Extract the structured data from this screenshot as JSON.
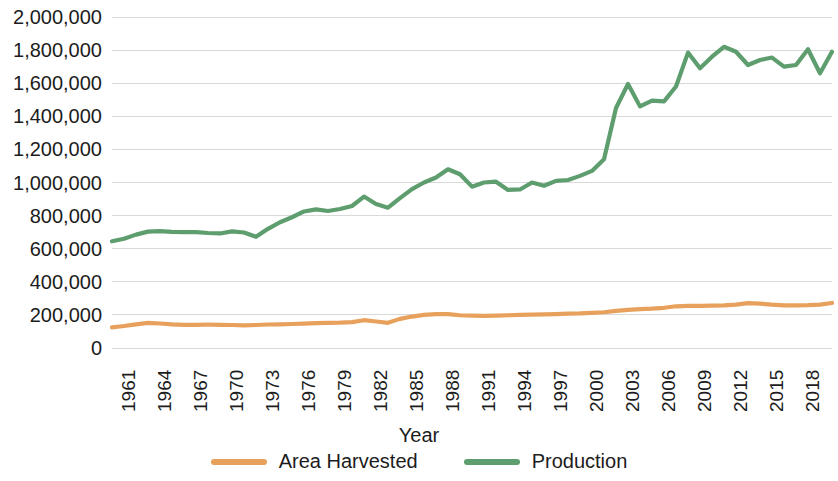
{
  "chart_data": {
    "type": "line",
    "title": "",
    "xlabel": "Year",
    "ylabel": "",
    "grid": true,
    "legend_position": "bottom",
    "xlim": [
      1961,
      2021
    ],
    "ylim": [
      0,
      2000000
    ],
    "y_ticks": [
      "0",
      "200,000",
      "400,000",
      "600,000",
      "800,000",
      "1,000,000",
      "1,200,000",
      "1,400,000",
      "1,600,000",
      "1,800,000",
      "2,000,000"
    ],
    "y_tick_values": [
      0,
      200000,
      400000,
      600000,
      800000,
      1000000,
      1200000,
      1400000,
      1600000,
      1800000,
      2000000
    ],
    "x_tick_labels": [
      "1961",
      "1964",
      "1967",
      "1970",
      "1973",
      "1976",
      "1979",
      "1982",
      "1985",
      "1988",
      "1991",
      "1994",
      "1997",
      "2000",
      "2003",
      "2006",
      "2009",
      "2012",
      "2015",
      "2018",
      "2021"
    ],
    "x": [
      1961,
      1962,
      1963,
      1964,
      1965,
      1966,
      1967,
      1968,
      1969,
      1970,
      1971,
      1972,
      1973,
      1974,
      1975,
      1976,
      1977,
      1978,
      1979,
      1980,
      1981,
      1982,
      1983,
      1984,
      1985,
      1986,
      1987,
      1988,
      1989,
      1990,
      1991,
      1992,
      1993,
      1994,
      1995,
      1996,
      1997,
      1998,
      1999,
      2000,
      2001,
      2002,
      2003,
      2004,
      2005,
      2006,
      2007,
      2008,
      2009,
      2010,
      2011,
      2012,
      2013,
      2014,
      2015,
      2016,
      2017,
      2018,
      2019,
      2020,
      2021
    ],
    "series": [
      {
        "name": "Area Harvested",
        "color": "#E8A15C",
        "values": [
          125000,
          133000,
          143000,
          152000,
          148000,
          143000,
          140000,
          140000,
          142000,
          140000,
          139000,
          137000,
          139000,
          142000,
          143000,
          145000,
          147000,
          150000,
          152000,
          153000,
          156000,
          168000,
          160000,
          152000,
          176000,
          190000,
          200000,
          205000,
          205000,
          198000,
          196000,
          194000,
          196000,
          198000,
          200000,
          202000,
          203000,
          205000,
          208000,
          209000,
          212000,
          216000,
          224000,
          230000,
          235000,
          238000,
          243000,
          252000,
          255000,
          254000,
          256000,
          258000,
          262000,
          271000,
          268000,
          262000,
          258000,
          258000,
          259000,
          262000,
          272000
        ]
      },
      {
        "name": "Production",
        "color": "#5E9E6E",
        "values": [
          645000,
          660000,
          685000,
          703000,
          706000,
          702000,
          700000,
          700000,
          695000,
          692000,
          705000,
          698000,
          672000,
          720000,
          760000,
          790000,
          825000,
          838000,
          828000,
          840000,
          858000,
          915000,
          870000,
          848000,
          905000,
          960000,
          1000000,
          1030000,
          1080000,
          1050000,
          975000,
          1000000,
          1005000,
          955000,
          958000,
          1000000,
          980000,
          1010000,
          1015000,
          1040000,
          1070000,
          1140000,
          1450000,
          1595000,
          1460000,
          1495000,
          1490000,
          1580000,
          1785000,
          1690000,
          1760000,
          1820000,
          1790000,
          1710000,
          1740000,
          1755000,
          1700000,
          1710000,
          1805000,
          1660000,
          1790000
        ]
      }
    ]
  },
  "axis": {
    "x_title": "Year"
  },
  "legend": {
    "items": [
      {
        "label": "Area Harvested",
        "color": "#E8A15C"
      },
      {
        "label": "Production",
        "color": "#5E9E6E"
      }
    ]
  }
}
